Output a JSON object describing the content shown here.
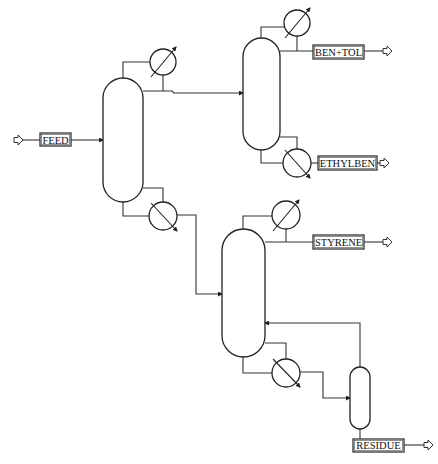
{
  "diagram": {
    "type": "process-flow-diagram",
    "streams": {
      "feed": "FEED",
      "ben_tol": "BEN+TOL",
      "ethylben": "ETHYLBEN",
      "styrene": "STYRENE",
      "residue": "RESIDUE"
    },
    "units": [
      {
        "id": "column-1",
        "type": "distillation-column",
        "condenser": true,
        "reboiler": true
      },
      {
        "id": "column-2",
        "type": "distillation-column",
        "condenser": true,
        "reboiler": true
      },
      {
        "id": "column-3",
        "type": "distillation-column",
        "condenser": true,
        "reboiler": true
      },
      {
        "id": "flash-drum",
        "type": "flash-vessel"
      }
    ],
    "connections": [
      {
        "from": "FEED",
        "to": "column-1"
      },
      {
        "from": "column-1 distillate",
        "to": "column-2"
      },
      {
        "from": "column-1 bottoms",
        "to": "column-3"
      },
      {
        "from": "column-2 distillate",
        "to": "BEN+TOL"
      },
      {
        "from": "column-2 bottoms",
        "to": "ETHYLBEN"
      },
      {
        "from": "column-3 distillate",
        "to": "STYRENE"
      },
      {
        "from": "column-3 bottoms",
        "to": "flash-drum"
      },
      {
        "from": "flash-drum vapor",
        "to": "column-3 (recycle)"
      },
      {
        "from": "flash-drum liquid",
        "to": "RESIDUE"
      }
    ],
    "colors": {
      "line": "#333333",
      "background": "#ffffff"
    }
  }
}
